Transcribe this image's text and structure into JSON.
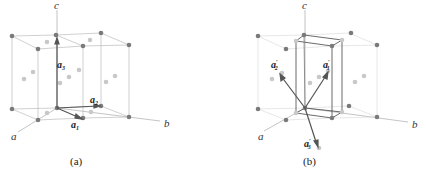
{
  "figure": {
    "panel_a": {
      "caption": "(a)",
      "axes": {
        "a": "a",
        "b": "b",
        "c": "c"
      },
      "vectors": [
        {
          "name": "a",
          "sub": "1",
          "prime": ""
        },
        {
          "name": "a",
          "sub": "2",
          "prime": ""
        },
        {
          "name": "a",
          "sub": "3",
          "prime": ""
        }
      ]
    },
    "panel_b": {
      "caption": "(b)",
      "axes": {
        "a": "a",
        "b": "b",
        "c": "c"
      },
      "vectors": [
        {
          "name": "a",
          "sub": "1",
          "prime": "′"
        },
        {
          "name": "a",
          "sub": "2",
          "prime": "′"
        },
        {
          "name": "a",
          "sub": "3",
          "prime": "′"
        }
      ]
    },
    "colors": {
      "dark_atom": "#7a7a7a",
      "light_atom": "#c8c8c8",
      "edge": "#a0a0a0",
      "vector": "#555555",
      "inner_cell": "#444444"
    }
  }
}
